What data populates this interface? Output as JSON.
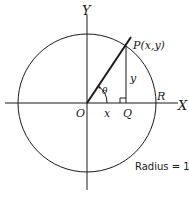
{
  "diagram": {
    "labels": {
      "y_axis": "Y",
      "x_axis": "X",
      "origin": "O",
      "point_p": "P(x,y)",
      "point_q": "Q",
      "point_r": "R",
      "x_segment": "x",
      "y_segment": "y",
      "angle": "θ",
      "radius_note": "Radius = 1"
    },
    "angle_degrees": 56,
    "radius": 1,
    "colors": {
      "stroke": "#1a1a1a",
      "background": "#ffffff"
    }
  }
}
